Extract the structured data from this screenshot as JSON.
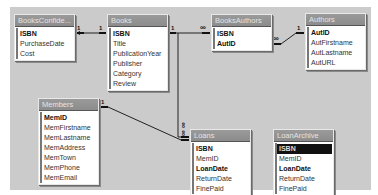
{
  "diagram": {
    "tables": [
      {
        "id": "booksconfidential",
        "title": "BooksConfide...",
        "fields": [
          {
            "name": "ISBN",
            "key": true
          },
          {
            "name": "PurchaseDate",
            "key": false
          },
          {
            "name": "Cost",
            "key": false
          }
        ]
      },
      {
        "id": "books",
        "title": "Books",
        "fields": [
          {
            "name": "ISBN",
            "key": true
          },
          {
            "name": "Title",
            "key": false
          },
          {
            "name": "PublicationYear",
            "key": false
          },
          {
            "name": "Publisher",
            "key": false
          },
          {
            "name": "Category",
            "key": false
          },
          {
            "name": "Review",
            "key": false
          }
        ]
      },
      {
        "id": "booksauthors",
        "title": "BooksAuthors",
        "fields": [
          {
            "name": "ISBN",
            "key": true
          },
          {
            "name": "AutID",
            "key": true
          }
        ]
      },
      {
        "id": "authors",
        "title": "Authors",
        "fields": [
          {
            "name": "AutID",
            "key": true
          },
          {
            "name": "AutFirstname",
            "key": false
          },
          {
            "name": "AutLastname",
            "key": false
          },
          {
            "name": "AutURL",
            "key": false
          }
        ]
      },
      {
        "id": "members",
        "title": "Members",
        "fields": [
          {
            "name": "MemID",
            "key": true
          },
          {
            "name": "MemFirstname",
            "key": false
          },
          {
            "name": "MemLastname",
            "key": false
          },
          {
            "name": "MemAddress",
            "key": false
          },
          {
            "name": "MemTown",
            "key": false
          },
          {
            "name": "MemPhone",
            "key": false
          },
          {
            "name": "MemEmail",
            "key": false
          }
        ]
      },
      {
        "id": "loans",
        "title": "Loans",
        "fields": [
          {
            "name": "ISBN",
            "key": true
          },
          {
            "name": "MemID",
            "key": false
          },
          {
            "name": "LoanDate",
            "key": true
          },
          {
            "name": "ReturnDate",
            "key": false
          },
          {
            "name": "FinePaid",
            "key": false
          }
        ]
      },
      {
        "id": "loanarchive",
        "title": "LoanArchive",
        "fields": [
          {
            "name": "ISBN",
            "key": true,
            "selected": true
          },
          {
            "name": "MemID",
            "key": false
          },
          {
            "name": "LoanDate",
            "key": true
          },
          {
            "name": "ReturnDate",
            "key": false
          },
          {
            "name": "FinePaid",
            "key": false
          }
        ]
      }
    ],
    "relationships": [
      {
        "from": "books.ISBN",
        "to": "booksconfidential.ISBN",
        "from_card": "1",
        "to_card": "1"
      },
      {
        "from": "books.ISBN",
        "to": "booksauthors.ISBN",
        "from_card": "1",
        "to_card": "∞"
      },
      {
        "from": "authors.AutID",
        "to": "booksauthors.AutID",
        "from_card": "1",
        "to_card": "∞"
      },
      {
        "from": "books.ISBN",
        "to": "loans.ISBN",
        "from_card": "1",
        "to_card": "∞"
      },
      {
        "from": "members.MemID",
        "to": "loans.MemID",
        "from_card": "1",
        "to_card": "∞"
      }
    ],
    "labels": {
      "one": "1",
      "many": "∞"
    }
  }
}
